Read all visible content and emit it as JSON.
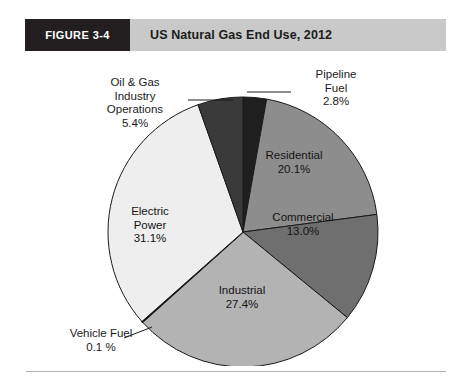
{
  "figure": {
    "number_label": "FIGURE 3-4",
    "title": "US Natural Gas End Use, 2012"
  },
  "colors": {
    "header_band": "#c9c9c9",
    "header_block": "#231f20",
    "outline": "#1a1a1a",
    "text": "#1b1b1b"
  },
  "labels": {
    "oil_gas": "Oil & Gas\nIndustry\nOperations\n5.4%",
    "pipeline": "Pipeline\nFuel\n2.8%",
    "residential": "Residential\n20.1%",
    "commercial": "Commercial\n13.0%",
    "industrial": "Industrial\n27.4%",
    "electric": "Electric\nPower\n31.1%",
    "vehicle": "Vehicle Fuel\n0.1 %"
  },
  "chart_data": {
    "type": "pie",
    "title": "US Natural Gas End Use, 2012",
    "subtitle": "",
    "xlabel": "",
    "ylabel": "",
    "units": "percent",
    "total": 100.0,
    "start_angle_deg": 0,
    "direction": "clockwise",
    "legend": "none (direct labels with leader lines)",
    "grid": false,
    "categories": [
      "Pipeline Fuel",
      "Residential",
      "Commercial",
      "Industrial",
      "Vehicle Fuel",
      "Electric Power",
      "Oil & Gas Industry Operations"
    ],
    "values": [
      2.8,
      20.1,
      13.0,
      27.4,
      0.1,
      31.1,
      5.4
    ],
    "slices": [
      {
        "label": "Pipeline Fuel",
        "value": 2.8,
        "display": "2.8%",
        "color": "#1f1f1f",
        "label_position": "outside",
        "leader_line": true
      },
      {
        "label": "Residential",
        "value": 20.1,
        "display": "20.1%",
        "color": "#8d8d8d",
        "label_position": "inside",
        "leader_line": false
      },
      {
        "label": "Commercial",
        "value": 13.0,
        "display": "13.0%",
        "color": "#6f6f6f",
        "label_position": "inside",
        "leader_line": false
      },
      {
        "label": "Industrial",
        "value": 27.4,
        "display": "27.4%",
        "color": "#b3b3b3",
        "label_position": "inside",
        "leader_line": false
      },
      {
        "label": "Vehicle Fuel",
        "value": 0.1,
        "display": "0.1 %",
        "color": "#101010",
        "label_position": "outside",
        "leader_line": true
      },
      {
        "label": "Electric Power",
        "value": 31.1,
        "display": "31.1%",
        "color": "#eeeeee",
        "label_position": "inside",
        "leader_line": false
      },
      {
        "label": "Oil & Gas Industry Operations",
        "value": 5.4,
        "display": "5.4%",
        "color": "#3a3a3a",
        "label_position": "outside",
        "leader_line": true
      }
    ]
  }
}
